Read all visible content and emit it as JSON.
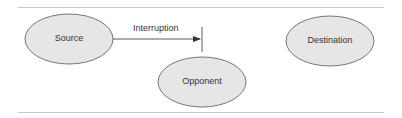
{
  "diagram": {
    "nodes": [
      {
        "id": "source",
        "label": "Source"
      },
      {
        "id": "opponent",
        "label": "Opponent"
      },
      {
        "id": "destination",
        "label": "Destination"
      }
    ],
    "edges": [
      {
        "from": "source",
        "to": "destination",
        "label": "Interruption",
        "blocked": true,
        "blocked_by": "opponent"
      }
    ],
    "colors": {
      "node_fill": "#e6e6e6",
      "node_stroke": "#555555",
      "line": "#333333",
      "rule": "#c8c8c8"
    }
  }
}
